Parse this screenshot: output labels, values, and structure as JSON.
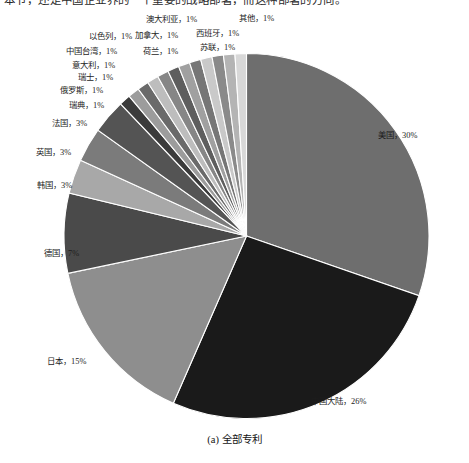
{
  "page": {
    "top_text_fragment": "本节，还是中国企业界的一个重要的战略部署，而这种部署的方向。",
    "caption": "(a) 全部专利"
  },
  "chart_data": {
    "type": "pie",
    "title": "",
    "caption": "(a) 全部专利",
    "legend": "none",
    "labels_show_percent": true,
    "start_angle_deg": 0,
    "direction": "clockwise",
    "categories": [
      "美国",
      "中国大陆",
      "日本",
      "德国",
      "韩国",
      "英国",
      "法国",
      "瑞典",
      "俄罗斯",
      "瑞士",
      "意大利",
      "中国台湾",
      "以色列",
      "荷兰",
      "加拿大",
      "澳大利亚",
      "苏联",
      "西班牙",
      "其他"
    ],
    "values": [
      30,
      26,
      15,
      7,
      3,
      3,
      3,
      1,
      1,
      1,
      1,
      1,
      1,
      1,
      1,
      1,
      1,
      1,
      1
    ],
    "value_suffix": "%",
    "colors": [
      "#6e6e6e",
      "#1a1a1a",
      "#8e8e8e",
      "#4a4a4a",
      "#a8a8a8",
      "#7b7b7b",
      "#545454",
      "#3b3b3b",
      "#9c9c9c",
      "#6a6a6a",
      "#bdbdbd",
      "#868686",
      "#5e5e5e",
      "#a0a0a0",
      "#767676",
      "#c9c9c9",
      "#8a8a8a",
      "#b4b4b4",
      "#d8d8d8"
    ],
    "slices": [
      {
        "name": "美国",
        "value": 30,
        "label": "美国，30%",
        "color": "#6e6e6e"
      },
      {
        "name": "中国大陆",
        "value": 26,
        "label": "中国大陆，26%",
        "color": "#1a1a1a"
      },
      {
        "name": "日本",
        "value": 15,
        "label": "日本，15%",
        "color": "#8e8e8e"
      },
      {
        "name": "德国",
        "value": 7,
        "label": "德国，7%",
        "color": "#4a4a4a"
      },
      {
        "name": "韩国",
        "value": 3,
        "label": "韩国，3%",
        "color": "#a8a8a8"
      },
      {
        "name": "英国",
        "value": 3,
        "label": "英国，3%",
        "color": "#7b7b7b"
      },
      {
        "name": "法国",
        "value": 3,
        "label": "法国，3%",
        "color": "#545454"
      },
      {
        "name": "瑞典",
        "value": 1,
        "label": "瑞典，1%",
        "color": "#3b3b3b"
      },
      {
        "name": "俄罗斯",
        "value": 1,
        "label": "俄罗斯，1%",
        "color": "#9c9c9c"
      },
      {
        "name": "瑞士",
        "value": 1,
        "label": "瑞士，1%",
        "color": "#6a6a6a"
      },
      {
        "name": "意大利",
        "value": 1,
        "label": "意大利，1%",
        "color": "#bdbdbd"
      },
      {
        "name": "中国台湾",
        "value": 1,
        "label": "中国台湾，1%",
        "color": "#868686"
      },
      {
        "name": "以色列",
        "value": 1,
        "label": "以色列，1%",
        "color": "#5e5e5e"
      },
      {
        "name": "荷兰",
        "value": 1,
        "label": "荷兰，1%",
        "color": "#a0a0a0"
      },
      {
        "name": "加拿大",
        "value": 1,
        "label": "加拿大，1%",
        "color": "#767676"
      },
      {
        "name": "澳大利亚",
        "value": 1,
        "label": "澳大利亚，1%",
        "color": "#c9c9c9"
      },
      {
        "name": "苏联",
        "value": 1,
        "label": "苏联，1%",
        "color": "#8a8a8a"
      },
      {
        "name": "西班牙",
        "value": 1,
        "label": "西班牙，1%",
        "color": "#b4b4b4"
      },
      {
        "name": "其他",
        "value": 1,
        "label": "其他，1%",
        "color": "#d8d8d8"
      }
    ]
  },
  "labels": {
    "usa": "美国，30%",
    "china": "中国大陆，26%",
    "japan": "日本，15%",
    "germany": "德国，7%",
    "korea": "韩国，3%",
    "uk": "英国，3%",
    "france": "法国，3%",
    "sweden": "瑞典，1%",
    "russia": "俄罗斯，1%",
    "switzerland": "瑞士，1%",
    "italy": "意大利，1%",
    "taiwan": "中国台湾，1%",
    "israel": "以色列，1%",
    "netherlands": "荷兰，1%",
    "canada": "加拿大，1%",
    "australia": "澳大利亚，1%",
    "ussr": "苏联，1%",
    "spain": "西班牙，1%",
    "other": "其他，1%"
  }
}
